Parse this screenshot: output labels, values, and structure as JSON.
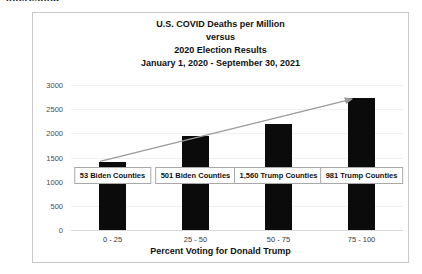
{
  "top_sliver_text": "Interesting",
  "chart_data": {
    "type": "bar",
    "title_lines": [
      "U.S. COVID Deaths per Million",
      "versus",
      "2020 Election Results",
      "January 1, 2020 - September 30, 2021"
    ],
    "xlabel": "Percent Voting for Donald Trump",
    "ylabel": "",
    "categories": [
      "0 - 25",
      "25 - 50",
      "50 - 75",
      "75 - 100"
    ],
    "values": [
      1400,
      1950,
      2200,
      2730
    ],
    "ylim": [
      0,
      3000
    ],
    "yticks": [
      "0",
      "500",
      "1000",
      "1500",
      "2000",
      "2500",
      "3000"
    ],
    "ytick_values": [
      0,
      500,
      1000,
      1500,
      2000,
      2500,
      3000
    ],
    "grid": true,
    "legend": "none",
    "bar_color": "#0b0b0b",
    "annotations": [
      {
        "text": "53 Biden Counties",
        "category": "0 - 25"
      },
      {
        "text": "501 Biden Counties",
        "category": "25 - 50"
      },
      {
        "text": "1,560 Trump Counties",
        "category": "50 - 75"
      },
      {
        "text": "981 Trump Counties",
        "category": "75 - 100"
      }
    ],
    "trendline": {
      "type": "arrow",
      "from_category": "0 - 25",
      "to_category": "75 - 100",
      "from_value": 1400,
      "to_value": 2730,
      "color": "#9a9a9a"
    }
  }
}
